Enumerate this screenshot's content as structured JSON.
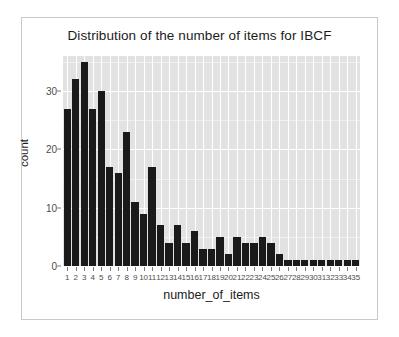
{
  "chart_data": {
    "type": "bar",
    "title": "Distribution of the number of items for IBCF",
    "xlabel": "number_of_items",
    "ylabel": "count",
    "categories": [
      "1",
      "2",
      "3",
      "4",
      "5",
      "6",
      "7",
      "8",
      "9",
      "10",
      "11",
      "12",
      "13",
      "14",
      "15",
      "16",
      "17",
      "18",
      "19",
      "20",
      "21",
      "22",
      "23",
      "24",
      "25",
      "26",
      "27",
      "28",
      "29",
      "30",
      "31",
      "32",
      "33",
      "34",
      "35"
    ],
    "values": [
      27,
      32,
      35,
      27,
      30,
      17,
      16,
      23,
      11,
      9,
      17,
      7,
      4,
      7,
      4,
      6,
      3,
      3,
      5,
      2,
      5,
      4,
      4,
      5,
      4,
      2,
      1,
      1,
      1,
      1,
      1,
      1,
      1,
      1,
      1
    ],
    "ylim": [
      0,
      36
    ],
    "y_ticks": [
      0,
      10,
      20,
      30
    ],
    "y_tick_labels": [
      "0",
      "10",
      "20",
      "30"
    ],
    "y_minor_ticks": [
      5,
      15,
      25,
      35
    ],
    "grid": true,
    "legend": "none",
    "colors": {
      "bar": "#1a1a1a",
      "panel_background": "#e2e2e2",
      "major_gridline": "#ffffff",
      "minor_gridline": "#f1f1f1",
      "axis_text": "#4d4d4d",
      "title_text": "#1c1c1c",
      "frame_border": "#c9c9c9",
      "figure_background": "#ffffff"
    }
  }
}
